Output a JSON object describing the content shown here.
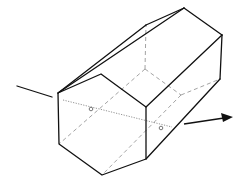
{
  "diagram": {
    "title": "",
    "colors": {
      "edge": "#111111",
      "hidden_edge": "#999999",
      "axis": "#777777",
      "background": "#ffffff"
    },
    "front_face": [
      [
        58,
        93
      ],
      [
        101,
        74
      ],
      [
        146,
        107
      ],
      [
        146,
        159
      ],
      [
        102,
        175
      ],
      [
        59,
        144
      ]
    ],
    "back_face": [
      [
        146,
        25
      ],
      [
        184,
        8
      ],
      [
        222,
        35
      ],
      [
        220,
        79
      ],
      [
        181,
        95
      ],
      [
        145,
        69
      ]
    ],
    "axis": {
      "start": [
        63,
        100
      ],
      "end": [
        172,
        127
      ],
      "points": [
        [
          91,
          109
        ],
        [
          161,
          128
        ]
      ]
    },
    "incoming_line": {
      "from": [
        17,
        86
      ],
      "to": [
        52,
        97
      ]
    },
    "outgoing_arrow": {
      "from": [
        184,
        124
      ],
      "to": [
        232,
        117
      ]
    }
  }
}
